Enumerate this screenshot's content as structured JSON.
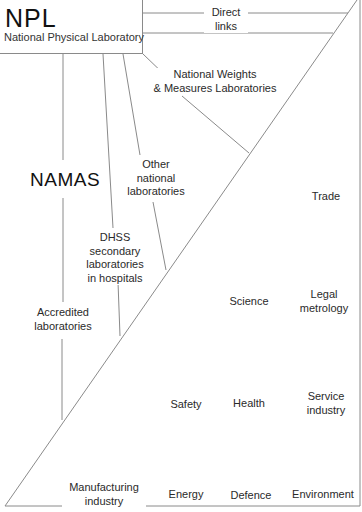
{
  "npl": {
    "acronym": "NPL",
    "full_name": "National Physical Laboratory"
  },
  "direct_links": {
    "line1": "Direct",
    "line2": "links"
  },
  "namas": "NAMAS",
  "laboratories": {
    "nwml": {
      "line1": "National Weights",
      "line2": "& Measures Laboratories"
    },
    "other_national": {
      "line1": "Other",
      "line2": "national",
      "line3": "laboratories"
    },
    "dhss": {
      "line1": "DHSS",
      "line2": "secondary",
      "line3": "laboratories",
      "line4": "in hospitals"
    },
    "accredited": {
      "line1": "Accredited",
      "line2": "laboratories"
    }
  },
  "sectors": {
    "trade": "Trade",
    "science": "Science",
    "legal_metrology": {
      "line1": "Legal",
      "line2": "metrology"
    },
    "safety": "Safety",
    "health": "Health",
    "service_industry": {
      "line1": "Service",
      "line2": "industry"
    },
    "manufacturing_industry": {
      "line1": "Manufacturing",
      "line2": "industry"
    },
    "energy": "Energy",
    "defence": "Defence",
    "environment": "Environment"
  },
  "colors": {
    "line": "#8a8a8a",
    "text": "#2a2a2a",
    "background": "#ffffff"
  }
}
